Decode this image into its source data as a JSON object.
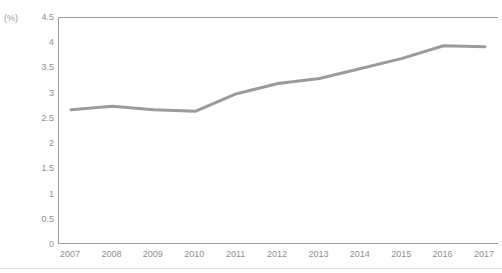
{
  "chart_data": {
    "type": "line",
    "title": "",
    "subtitle": "",
    "xlabel": "",
    "ylabel": "",
    "unit_label": "(%)",
    "categories": [
      "2007",
      "2008",
      "2009",
      "2010",
      "2011",
      "2012",
      "2013",
      "2014",
      "2015",
      "2016",
      "2017"
    ],
    "values": [
      2.68,
      2.75,
      2.68,
      2.65,
      3.0,
      3.2,
      3.3,
      3.5,
      3.7,
      3.95,
      3.93
    ],
    "series": [
      {
        "name": "",
        "values": [
          2.68,
          2.75,
          2.68,
          2.65,
          3.0,
          3.2,
          3.3,
          3.5,
          3.7,
          3.95,
          3.93
        ],
        "color": "#9b9b9b"
      }
    ],
    "ylim": [
      0,
      4.5
    ],
    "ytick_values": [
      4.5,
      4,
      3.5,
      3,
      2.5,
      2,
      1.5,
      1,
      0.5,
      0
    ],
    "ytick_labels": [
      "4.5",
      "4",
      "3.5",
      "3",
      "2.5",
      "2",
      "1.5",
      "1",
      "0.5",
      "0"
    ],
    "grid": false,
    "legend": "none",
    "line_color": "#9b9b9b",
    "axis_color": "#9a9a9a",
    "tick_label_color": "#8f8f8f",
    "background_color": "#ffffff"
  }
}
